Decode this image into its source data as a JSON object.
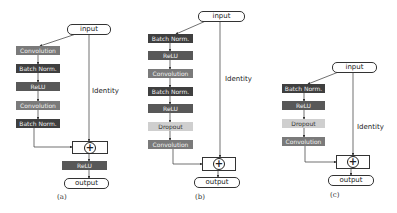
{
  "panels": {
    "a": {
      "caption": "(a)",
      "input_label": "input",
      "output_label": "output",
      "identity_label": "Identity",
      "sum_symbol": "+",
      "blocks": [
        "Convolution",
        "Batch Norm.",
        "ReLU",
        "Convolution",
        "Batch Norm."
      ],
      "post_block": "ReLU"
    },
    "b": {
      "caption": "(b)",
      "input_label": "input",
      "output_label": "output",
      "identity_label": "Identity",
      "sum_symbol": "+",
      "blocks": [
        "Batch Norm.",
        "ReLU",
        "Convolution",
        "Batch Norm.",
        "ReLU",
        "Dropout",
        "Convolution"
      ]
    },
    "c": {
      "caption": "(c)",
      "input_label": "input",
      "output_label": "output",
      "identity_label": "Identity",
      "sum_symbol": "+",
      "blocks": [
        "Batch Norm.",
        "ReLU",
        "Dropout",
        "Convolution"
      ]
    }
  },
  "colors": {
    "convolution": "#7a7a7a",
    "batch_norm": "#3f3f3f",
    "relu": "#585858",
    "dropout": "#cfcfcf"
  }
}
